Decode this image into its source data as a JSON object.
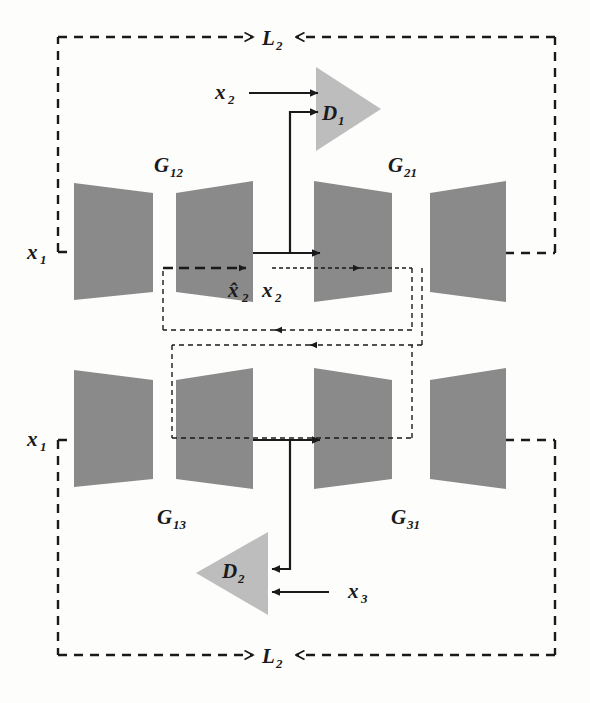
{
  "figure": {
    "type": "diagram",
    "kind": "neural-network-architecture",
    "palette": {
      "generator_fill": "#8a8a8a",
      "discriminator_fill": "#bdbdbd",
      "stroke": "#1a1a1a",
      "background": "#fdfdfc"
    }
  },
  "labels": {
    "loss_top": "L",
    "loss_top_sub": "2",
    "loss_bottom": "L",
    "loss_bottom_sub": "2",
    "generator_g12": "G",
    "generator_g12_sub": "12",
    "generator_g21": "G",
    "generator_g21_sub": "21",
    "generator_g13": "G",
    "generator_g13_sub": "13",
    "generator_g31": "G",
    "generator_g31_sub": "31",
    "discriminator_d1": "D",
    "discriminator_d1_sub": "1",
    "discriminator_d2": "D",
    "discriminator_d2_sub": "2",
    "input_x1_top": "x",
    "input_x1_top_sub": "1",
    "input_x1_bottom": "x",
    "input_x1_bottom_sub": "1",
    "input_x2_top": "x",
    "input_x2_top_sub": "2",
    "input_x3_bottom": "x",
    "input_x3_bottom_sub": "3",
    "latent_x2_hat": "x̂",
    "latent_x2_hat_sub": "2",
    "latent_x2": "x",
    "latent_x2_sub": "2"
  },
  "nodes": {
    "top_row": [
      {
        "name": "encoder-g12",
        "role": "encoder",
        "shape": "trapezoid-narrowing"
      },
      {
        "name": "decoder-g12",
        "role": "decoder",
        "shape": "trapezoid-widening"
      },
      {
        "name": "encoder-g21",
        "role": "encoder",
        "shape": "trapezoid-narrowing"
      },
      {
        "name": "decoder-g21",
        "role": "decoder",
        "shape": "trapezoid-widening"
      }
    ],
    "bottom_row": [
      {
        "name": "encoder-g13",
        "role": "encoder",
        "shape": "trapezoid-narrowing"
      },
      {
        "name": "decoder-g13",
        "role": "decoder",
        "shape": "trapezoid-widening"
      },
      {
        "name": "encoder-g31",
        "role": "encoder",
        "shape": "trapezoid-narrowing"
      },
      {
        "name": "decoder-g31",
        "role": "decoder",
        "shape": "trapezoid-widening"
      }
    ],
    "discriminators": [
      {
        "name": "discriminator-d1",
        "shape": "triangle-right"
      },
      {
        "name": "discriminator-d2",
        "shape": "triangle-left"
      }
    ]
  },
  "edges": {
    "solid": [
      "x2-to-d1",
      "latent-branch-to-d1",
      "g12-latent-to-g21",
      "g13-latent-to-g31",
      "latent-branch-to-d2",
      "x3-to-d2"
    ],
    "dashed": [
      "x1-top-loop-to-L2",
      "g21-output-to-L2",
      "x1-bottom-loop-to-L2",
      "g31-output-to-L2",
      "cycle-feedback-outer",
      "cycle-feedback-inner"
    ],
    "dotted": [
      "latent-x2-to-g21-encoder"
    ]
  }
}
